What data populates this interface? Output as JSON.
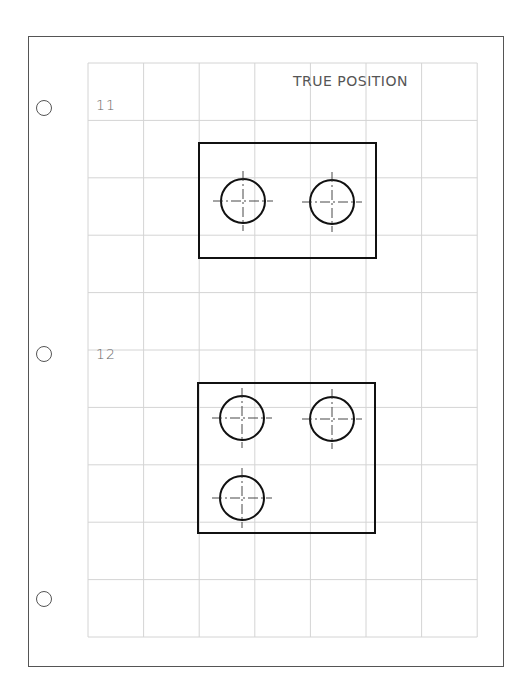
{
  "worksheet": {
    "title": "TRUE POSITION",
    "problems": [
      {
        "number": "11",
        "plate": {
          "x": 199,
          "y": 143,
          "w": 177,
          "h": 115
        },
        "holes": [
          {
            "cx": 243,
            "cy": 201,
            "r": 22
          },
          {
            "cx": 332,
            "cy": 202,
            "r": 22
          }
        ]
      },
      {
        "number": "12",
        "plate": {
          "x": 198,
          "y": 383,
          "w": 177,
          "h": 150
        },
        "holes": [
          {
            "cx": 242,
            "cy": 418,
            "r": 22
          },
          {
            "cx": 332,
            "cy": 419,
            "r": 22
          },
          {
            "cx": 242,
            "cy": 498,
            "r": 22
          }
        ]
      }
    ],
    "grid": {
      "x": 88,
      "y": 63,
      "cols": 7,
      "rows": 10,
      "col_w": 55.6,
      "row_h": 57.4,
      "color": "#d4d4d4"
    },
    "binder_holes": [
      {
        "x": 36,
        "y": 100
      },
      {
        "x": 36,
        "y": 346
      },
      {
        "x": 36,
        "y": 591
      }
    ],
    "colors": {
      "ink": "#111111",
      "border": "#555555",
      "grid": "#d4d4d4"
    }
  }
}
